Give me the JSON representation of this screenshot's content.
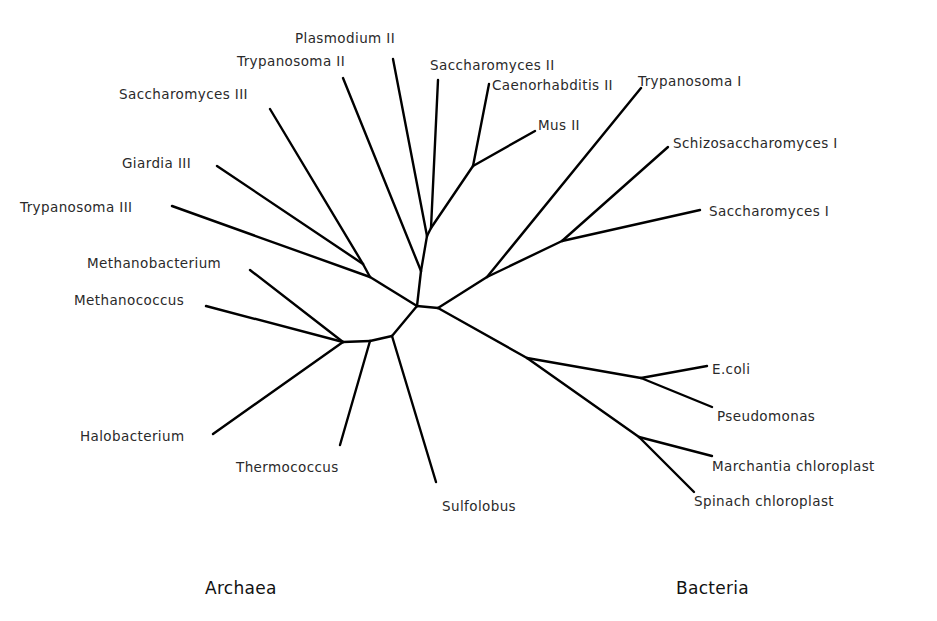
{
  "diagram": {
    "type": "unrooted phylogenetic tree",
    "domain_labels": [
      {
        "id": "archaea",
        "label": "Archaea",
        "x": 205,
        "y": 594
      },
      {
        "id": "bacteria",
        "label": "Bacteria",
        "x": 676,
        "y": 594
      }
    ],
    "nodes": {
      "A": [
        417,
        306
      ],
      "B": [
        438,
        308
      ],
      "C": [
        392,
        336
      ],
      "D": [
        370,
        341
      ],
      "E": [
        343,
        342
      ],
      "Gj": [
        363,
        264
      ],
      "T3j": [
        370,
        277
      ],
      "T2j": [
        421,
        271
      ],
      "Pj": [
        427,
        236
      ],
      "S2j": [
        431,
        228
      ],
      "CMj": [
        473,
        166
      ],
      "T1j": [
        487,
        277
      ],
      "S1j": [
        562,
        241
      ],
      "Bj": [
        527,
        358
      ],
      "ECj": [
        641,
        378
      ],
      "CHj": [
        639,
        437
      ]
    },
    "edges": [
      [
        "A",
        "B"
      ],
      [
        "A",
        "C"
      ],
      [
        "C",
        "D"
      ],
      [
        "D",
        "E"
      ],
      [
        "A",
        "T3j"
      ],
      [
        "T3j",
        "Gj"
      ],
      [
        "A",
        "T2j"
      ],
      [
        "T2j",
        "Pj"
      ],
      [
        "Pj",
        "S2j"
      ],
      [
        "S2j",
        "CMj"
      ],
      [
        "B",
        "T1j"
      ],
      [
        "T1j",
        "S1j"
      ],
      [
        "B",
        "Bj"
      ],
      [
        "Bj",
        "ECj"
      ],
      [
        "Bj",
        "CHj"
      ]
    ],
    "leaves": [
      {
        "name": "Trypanosoma III",
        "from": "T3j",
        "tip": [
          172,
          206
        ],
        "label_x": 20,
        "label_y": 212,
        "anchor": "start"
      },
      {
        "name": "Giardia III",
        "from": "Gj",
        "tip": [
          217,
          166
        ],
        "label_x": 122,
        "label_y": 168,
        "anchor": "start"
      },
      {
        "name": "Saccharomyces III",
        "from": "Gj",
        "tip": [
          270,
          109
        ],
        "label_x": 119,
        "label_y": 99,
        "anchor": "start"
      },
      {
        "name": "Trypanosoma II",
        "from": "T2j",
        "tip": [
          343,
          78
        ],
        "label_x": 237,
        "label_y": 66,
        "anchor": "start"
      },
      {
        "name": "Plasmodium II",
        "from": "Pj",
        "tip": [
          393,
          59
        ],
        "label_x": 295,
        "label_y": 43,
        "anchor": "start"
      },
      {
        "name": "Saccharomyces II",
        "from": "S2j",
        "tip": [
          438,
          80
        ],
        "label_x": 430,
        "label_y": 70,
        "anchor": "start"
      },
      {
        "name": "Caenorhabditis II",
        "from": "CMj",
        "tip": [
          489,
          84
        ],
        "label_x": 492,
        "label_y": 90,
        "anchor": "start"
      },
      {
        "name": "Mus II",
        "from": "CMj",
        "tip": [
          535,
          131
        ],
        "label_x": 538,
        "label_y": 130,
        "anchor": "start"
      },
      {
        "name": "Trypanosoma I",
        "from": "T1j",
        "tip": [
          641,
          88
        ],
        "label_x": 638,
        "label_y": 86,
        "anchor": "start"
      },
      {
        "name": "Schizosaccharomyces I",
        "from": "S1j",
        "tip": [
          668,
          147
        ],
        "label_x": 673,
        "label_y": 148,
        "anchor": "start"
      },
      {
        "name": "Saccharomyces I",
        "from": "S1j",
        "tip": [
          700,
          210
        ],
        "label_x": 709,
        "label_y": 216,
        "anchor": "start"
      },
      {
        "name": "E.coli",
        "from": "ECj",
        "tip": [
          707,
          366
        ],
        "label_x": 712,
        "label_y": 374,
        "anchor": "start"
      },
      {
        "name": "Pseudomonas",
        "from": "ECj",
        "tip": [
          712,
          407
        ],
        "label_x": 717,
        "label_y": 421,
        "anchor": "start"
      },
      {
        "name": "Marchantia chloroplast",
        "from": "CHj",
        "tip": [
          712,
          456
        ],
        "label_x": 712,
        "label_y": 471,
        "anchor": "start"
      },
      {
        "name": "Spinach chloroplast",
        "from": "CHj",
        "tip": [
          694,
          492
        ],
        "label_x": 694,
        "label_y": 506,
        "anchor": "start"
      },
      {
        "name": "Sulfolobus",
        "from": "C",
        "tip": [
          436,
          482
        ],
        "label_x": 442,
        "label_y": 511,
        "anchor": "start"
      },
      {
        "name": "Thermococcus",
        "from": "D",
        "tip": [
          340,
          445
        ],
        "label_x": 236,
        "label_y": 472,
        "anchor": "start"
      },
      {
        "name": "Halobacterium",
        "from": "E",
        "tip": [
          213,
          434
        ],
        "label_x": 80,
        "label_y": 441,
        "anchor": "start"
      },
      {
        "name": "Methanococcus",
        "from": "E",
        "tip": [
          206,
          306
        ],
        "label_x": 74,
        "label_y": 305,
        "anchor": "start"
      },
      {
        "name": "Methanobacterium",
        "from": "E",
        "tip": [
          250,
          270
        ],
        "label_x": 87,
        "label_y": 268,
        "anchor": "start"
      }
    ],
    "colors": {
      "branch": "#000000",
      "label": "#2a2a2a",
      "background": "#ffffff"
    }
  }
}
